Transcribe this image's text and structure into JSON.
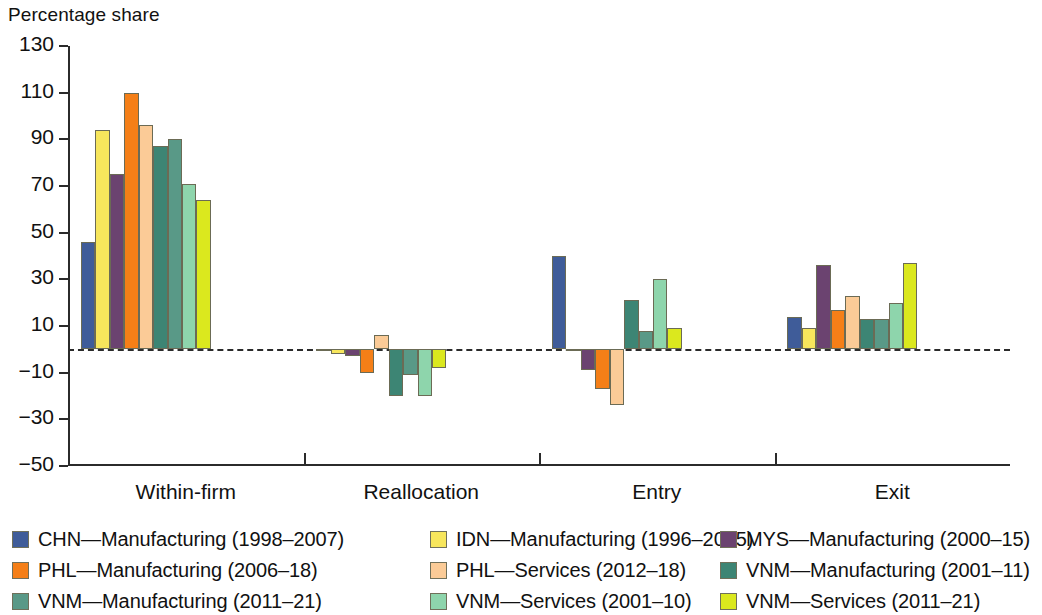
{
  "axis_title": "Percentage share",
  "legend": {
    "items": [
      {
        "label": "CHN—Manufacturing (1998–2007)",
        "color": "#3f5c99",
        "name": "legend-item-chn-manufacturing"
      },
      {
        "label": "IDN—Manufacturing (1996–2015)",
        "color": "#f7e濃",
        "name": "legend-item-idn-manufacturing"
      },
      {
        "label": "MYS—Manufacturing (2000–15)",
        "color": "#6b4370",
        "name": "legend-item-mys-manufacturing"
      },
      {
        "label": "PHL—Manufacturing (2006–18)",
        "color": "#f57f17",
        "name": "legend-item-phl-manufacturing"
      },
      {
        "label": "PHL—Services (2012–18)",
        "color": "#fbcb97",
        "name": "legend-item-phl-services"
      },
      {
        "label": "VNM—Manufacturing (2001–11)",
        "color": "#3d8574",
        "name": "legend-item-vnm-manufacturing-2001"
      },
      {
        "label": "VNM—Manufacturing (2011–21)",
        "color": "#599987",
        "name": "legend-item-vnm-manufacturing-2011"
      },
      {
        "label": "VNM—Services (2001–10)",
        "color": "#8ed5ac",
        "name": "legend-item-vnm-services-2001"
      },
      {
        "label": "VNM—Services (2011–21)",
        "color": "#dbe81e",
        "name": "legend-item-vnm-services-2011"
      }
    ]
  },
  "chart_data": {
    "type": "bar",
    "title": "",
    "ylabel": "Percentage share",
    "xlabel": "",
    "ylim": [
      -50,
      130
    ],
    "yticks": [
      130,
      110,
      90,
      70,
      50,
      30,
      10,
      -10,
      -30,
      -50
    ],
    "ytick_labels": [
      "130",
      "110",
      "90",
      "70",
      "50",
      "30",
      "10",
      "−10",
      "−30",
      "−50"
    ],
    "grid": false,
    "legend_position": "bottom",
    "zero_line": true,
    "categories": [
      "Within-firm",
      "Reallocation",
      "Entry",
      "Exit"
    ],
    "series": [
      {
        "name": "CHN—Manufacturing (1998–2007)",
        "color": "#3f5c99",
        "values": [
          46,
          -0.5,
          40,
          14
        ]
      },
      {
        "name": "IDN—Manufacturing (1996–2015)",
        "color": "#f7e65c",
        "values": [
          94,
          -2,
          -0.5,
          9
        ]
      },
      {
        "name": "MYS—Manufacturing (2000–15)",
        "color": "#6b4370",
        "values": [
          75,
          -3,
          -9,
          36
        ]
      },
      {
        "name": "PHL—Manufacturing (2006–18)",
        "color": "#f57f17",
        "values": [
          110,
          -10,
          -17,
          17
        ]
      },
      {
        "name": "PHL—Services (2012–18)",
        "color": "#fbcb97",
        "values": [
          96,
          6,
          -24,
          23
        ]
      },
      {
        "name": "VNM—Manufacturing (2001–11)",
        "color": "#3d8574",
        "values": [
          87,
          -20,
          21,
          13
        ]
      },
      {
        "name": "VNM—Manufacturing (2011–21)",
        "color": "#599987",
        "values": [
          90,
          -11,
          8,
          13
        ]
      },
      {
        "name": "VNM—Services (2001–10)",
        "color": "#8ed5ac",
        "values": [
          71,
          -20,
          30,
          20
        ]
      },
      {
        "name": "VNM—Services (2011–21)",
        "color": "#dbe81e",
        "values": [
          64,
          -8,
          9,
          37
        ]
      }
    ]
  }
}
